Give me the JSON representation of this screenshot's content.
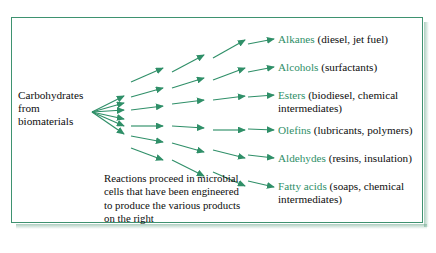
{
  "diagram": {
    "title_text_present": false,
    "accent_color": "#2f8f68",
    "border_color": "#3e9270",
    "text_color": "#0d0d0d",
    "source": {
      "lines": [
        "Carbohydrates",
        "from",
        "biomaterials"
      ]
    },
    "caption": {
      "lines": [
        "Reactions proceed in microbial",
        "cells that have been engineered",
        "to produce the various products",
        "on the right"
      ]
    },
    "products": [
      {
        "name": "Alkanes",
        "detail": " (diesel, jet fuel)",
        "detail2": ""
      },
      {
        "name": "Alcohols",
        "detail": " (surfactants)",
        "detail2": ""
      },
      {
        "name": "Esters",
        "detail": " (biodiesel, chemical",
        "detail2": "intermediates)"
      },
      {
        "name": "Olefins",
        "detail": " (lubricants, polymers)",
        "detail2": ""
      },
      {
        "name": "Aldehydes",
        "detail": " (resins, insulation)",
        "detail2": ""
      },
      {
        "name": "Fatty acids",
        "detail": " (soaps, chemical",
        "detail2": "intermediates)"
      }
    ]
  },
  "chart_data": {
    "type": "diagram",
    "flow": "left-to-right multi-stage fan",
    "stages": 4,
    "branches_per_stage": 6,
    "input": "Carbohydrates from biomaterials",
    "outputs": [
      "Alkanes",
      "Alcohols",
      "Esters",
      "Olefins",
      "Aldehydes",
      "Fatty acids"
    ]
  }
}
